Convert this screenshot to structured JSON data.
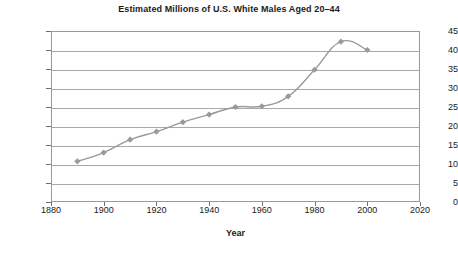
{
  "chart_data": {
    "type": "line",
    "title": "Estimated Millions of U.S. White Males Aged 20–44",
    "xlabel": "Year",
    "ylabel": "",
    "x": [
      1890,
      1900,
      1910,
      1920,
      1930,
      1940,
      1950,
      1960,
      1970,
      1980,
      1990,
      2000
    ],
    "values": [
      10.7,
      13.0,
      16.4,
      18.5,
      21.0,
      23.0,
      25.0,
      25.2,
      27.8,
      34.8,
      42.2,
      40.0
    ],
    "xlim": [
      1880,
      2020
    ],
    "ylim": [
      0,
      45
    ],
    "xticks": [
      1880,
      1900,
      1920,
      1940,
      1960,
      1980,
      2000,
      2020
    ],
    "yticks": [
      0,
      5,
      10,
      15,
      20,
      25,
      30,
      35,
      40,
      45
    ],
    "grid": "horizontal",
    "legend": "none",
    "marker": "diamond",
    "series_color": "#9a9a9a",
    "grid_color": "#a8a8a8",
    "frame_color": "#9a9a9a"
  }
}
